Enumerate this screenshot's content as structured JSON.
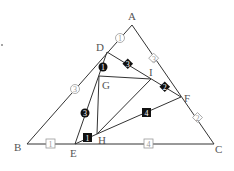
{
  "diagram": {
    "points": {
      "A": {
        "label": "A",
        "x": 132,
        "y": 25
      },
      "B": {
        "label": "B",
        "x": 27,
        "y": 144
      },
      "C": {
        "label": "C",
        "x": 214,
        "y": 144
      },
      "D": {
        "label": "D",
        "x": 107,
        "y": 52
      },
      "E": {
        "label": "E",
        "x": 75,
        "y": 144
      },
      "F": {
        "label": "F",
        "x": 181,
        "y": 97
      },
      "G": {
        "label": "G",
        "x": 99,
        "y": 76
      },
      "H": {
        "label": "H",
        "x": 97,
        "y": 134
      },
      "I": {
        "label": "I",
        "x": 151,
        "y": 79
      }
    },
    "markers": {
      "AD": {
        "text": "1",
        "shape": "circle-outline"
      },
      "DB": {
        "text": "3",
        "shape": "circle-outline"
      },
      "AF": {
        "text": "3",
        "shape": "diamond-outline"
      },
      "FC": {
        "text": "2",
        "shape": "diamond-outline"
      },
      "BE": {
        "text": "1",
        "shape": "square-outline"
      },
      "EC": {
        "text": "4",
        "shape": "square-outline"
      },
      "DG": {
        "text": "1",
        "shape": "circle-filled"
      },
      "GE": {
        "text": "3",
        "shape": "circle-filled"
      },
      "DI": {
        "text": "3",
        "shape": "diamond-filled"
      },
      "IF": {
        "text": "2",
        "shape": "diamond-filled"
      },
      "EH": {
        "text": "1",
        "shape": "square-filled"
      },
      "HF": {
        "text": "4",
        "shape": "square-filled"
      }
    },
    "colors": {
      "line": "#333333",
      "outline_marker": "#999999",
      "filled_marker": "#111111"
    }
  }
}
